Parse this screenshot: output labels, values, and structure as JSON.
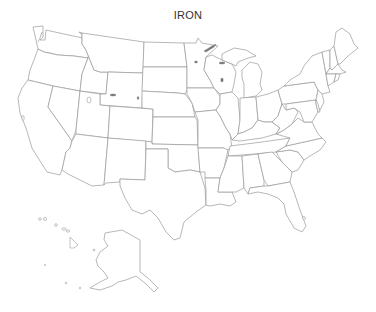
{
  "map": {
    "title": "IRON",
    "type": "choropleth-outline",
    "region": "United States",
    "fill_color": "#ffffff",
    "border_color": "#9a9a9a",
    "lake_color": "#7a7a7a",
    "states": [
      "WA",
      "OR",
      "CA",
      "ID",
      "NV",
      "MT",
      "WY",
      "UT",
      "AZ",
      "CO",
      "NM",
      "ND",
      "SD",
      "NE",
      "KS",
      "OK",
      "TX",
      "MN",
      "IA",
      "MO",
      "AR",
      "LA",
      "WI",
      "IL",
      "MI",
      "IN",
      "OH",
      "KY",
      "TN",
      "MS",
      "AL",
      "GA",
      "FL",
      "SC",
      "NC",
      "VA",
      "WV",
      "PA",
      "NY",
      "VT",
      "NH",
      "ME",
      "MA",
      "CT",
      "RI",
      "NJ",
      "DE",
      "MD",
      "AK",
      "HI"
    ],
    "insets": [
      "Alaska",
      "Hawaii"
    ],
    "legend": null
  }
}
